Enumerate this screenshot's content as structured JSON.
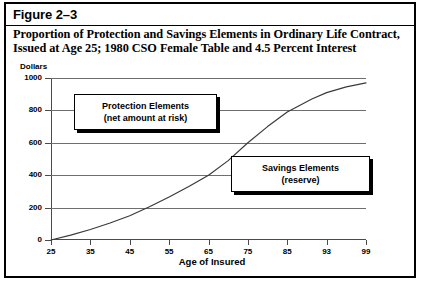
{
  "figure": {
    "label": "Figure 2–3",
    "title_line1": "Proportion of Protection and Savings Elements in Ordinary Life Contract,",
    "title_line2": "Issued at Age 25; 1980 CSO Female Table and 4.5 Percent Interest"
  },
  "callouts": {
    "protection": {
      "line1": "Protection Elements",
      "line2": "(net amount at risk)"
    },
    "savings": {
      "line1": "Savings Elements",
      "line2": "(reserve)"
    }
  },
  "chart_data": {
    "type": "line",
    "title": "Proportion of Protection and Savings Elements in Ordinary Life Contract, Issued at Age 25; 1980 CSO Female Table and 4.5 Percent Interest",
    "xlabel": "Age of Insured",
    "ylabel": "Dollars",
    "ylim": [
      0,
      1000
    ],
    "xlim": [
      25,
      99
    ],
    "grid": true,
    "legend": false,
    "yticks": [
      0,
      200,
      400,
      600,
      800,
      1000
    ],
    "ytick_labels": [
      "0",
      "200",
      "400",
      "600",
      "800",
      "1000"
    ],
    "xticks": [
      25,
      35,
      45,
      55,
      65,
      75,
      85,
      93,
      99
    ],
    "xtick_labels": [
      "25",
      "35",
      "45",
      "55",
      "65",
      "75",
      "85",
      "93",
      "99"
    ],
    "series": [
      {
        "name": "reserve",
        "x": [
          25,
          30,
          35,
          40,
          45,
          50,
          55,
          60,
          65,
          70,
          75,
          80,
          85,
          90,
          93,
          96,
          99
        ],
        "values": [
          0,
          30,
          65,
          105,
          150,
          205,
          265,
          330,
          400,
          490,
          600,
          700,
          790,
          870,
          910,
          945,
          970
        ]
      }
    ],
    "annotations": [
      {
        "text": "Protection Elements (net amount at risk)",
        "region": "above-curve"
      },
      {
        "text": "Savings Elements (reserve)",
        "region": "below-curve"
      }
    ]
  }
}
